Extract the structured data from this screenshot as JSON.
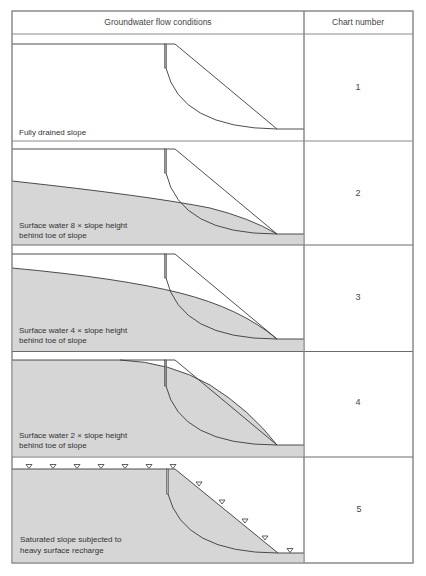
{
  "table": {
    "header": {
      "conditions": "Groundwater flow conditions",
      "chart_number": "Chart number"
    },
    "rows": [
      {
        "label_lines": [
          "Fully drained slope"
        ],
        "chart_number": "1",
        "water_condition": "none"
      },
      {
        "label_lines": [
          "Surface water 8 × slope height",
          "behind toe of slope"
        ],
        "chart_number": "2",
        "water_condition": "water table at 8x slope height behind toe"
      },
      {
        "label_lines": [
          "Surface water 4 × slope height",
          "behind toe of slope"
        ],
        "chart_number": "3",
        "water_condition": "water table at 4x slope height behind toe"
      },
      {
        "label_lines": [
          "Surface water 2 × slope height",
          "behind toe of slope"
        ],
        "chart_number": "4",
        "water_condition": "water table at 2x slope height behind toe"
      },
      {
        "label_lines": [
          "Saturated slope subjected to",
          "heavy surface recharge"
        ],
        "chart_number": "5",
        "water_condition": "saturated, water-table markers on surface"
      }
    ]
  },
  "colors": {
    "border": "#8a8a8a",
    "line": "#3a3a3a",
    "water_fill": "#d6d6d6",
    "text": "#333333"
  }
}
